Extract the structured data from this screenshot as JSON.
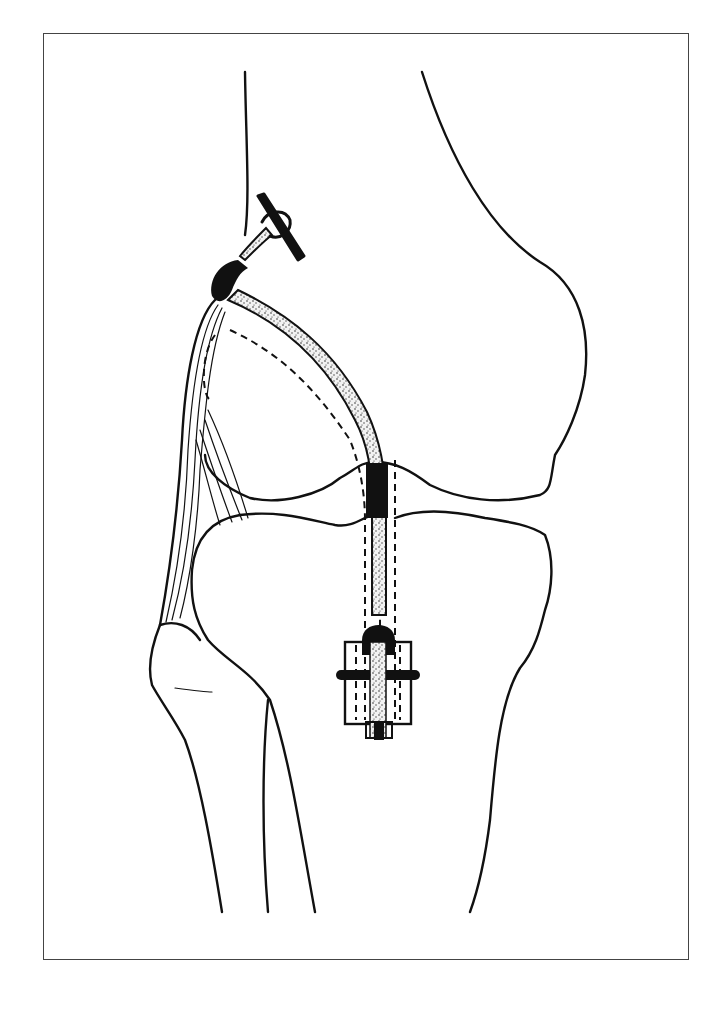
{
  "figure": {
    "title": "",
    "colors": {
      "line": "#111111",
      "background": "#ffffff",
      "frame": "#444444",
      "graft_fill": "#d8d8d8"
    },
    "elements": [
      {
        "id": "femur",
        "label": "Femur"
      },
      {
        "id": "tibia",
        "label": "Tibia"
      },
      {
        "id": "fibula",
        "label": "Fibula"
      },
      {
        "id": "graft",
        "label": "Graft"
      },
      {
        "id": "staple",
        "label": "Femoral staple fixation"
      },
      {
        "id": "button",
        "label": "Tibial button/washer fixation"
      },
      {
        "id": "lateral-ligament",
        "label": "Lateral ligament fibers"
      }
    ]
  }
}
